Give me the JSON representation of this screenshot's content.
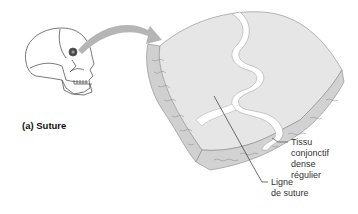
{
  "figure": {
    "caption": "(a) Suture",
    "labels": {
      "tissue_line1": "Tissu",
      "tissue_line2": "conjonctif",
      "tissue_line3": "dense",
      "tissue_line4": "régulier",
      "suture_line1": "Ligne",
      "suture_line2": "de suture"
    },
    "colors": {
      "bone_surface": "#e4e4e4",
      "bone_edge": "#c8c8c8",
      "suture_gap": "#ffffff",
      "arrow": "#b0b0b0",
      "outline": "#666666",
      "leader_line": "#333333"
    }
  }
}
